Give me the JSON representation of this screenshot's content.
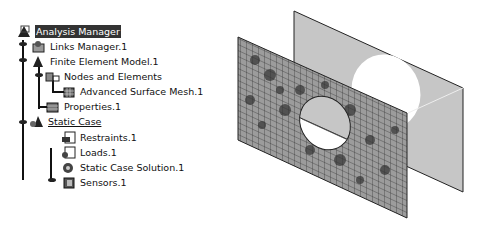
{
  "tree": {
    "root": {
      "label": "Analysis Manager",
      "icon": "analysis-manager-icon",
      "selected": true
    },
    "items": [
      {
        "label": "Links Manager.1",
        "icon": "links-manager-icon"
      },
      {
        "label": "Finite Element Model.1",
        "icon": "finite-element-model-icon"
      },
      {
        "label": "Nodes and Elements",
        "icon": "nodes-elements-icon"
      },
      {
        "label": "Advanced Surface Mesh.1",
        "icon": "surface-mesh-icon"
      },
      {
        "label": "Properties.1",
        "icon": "properties-icon"
      },
      {
        "label": "Static Case",
        "icon": "static-case-icon",
        "underlined": true
      },
      {
        "label": "Restraints.1",
        "icon": "restraints-icon"
      },
      {
        "label": "Loads.1",
        "icon": "loads-icon"
      },
      {
        "label": "Static Case Solution.1",
        "icon": "solution-icon"
      },
      {
        "label": "Sensors.1",
        "icon": "sensors-icon"
      }
    ]
  },
  "viewport": {
    "description": "3D view of meshed plate with circular hole and parallel back plate",
    "colors": {
      "mesh_plate": "#9a9a9a",
      "back_plate": "#c4c4c4",
      "edge": "#222222"
    }
  }
}
